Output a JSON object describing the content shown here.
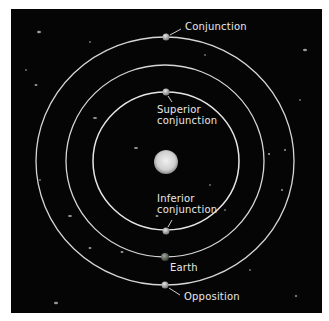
{
  "diagram": {
    "background_color": "#050505",
    "orbit_color": "#d8d8d8",
    "sun": {
      "label": "",
      "color": "#d9d9d9"
    },
    "labels": {
      "conjunction": "Conjunction",
      "superior_line1": "Superior",
      "superior_line2": "conjunction",
      "inferior_line1": "Inferior",
      "inferior_line2": "conjunction",
      "earth": "Earth",
      "opposition": "Opposition"
    },
    "orbits": [
      {
        "name": "inner-planet-orbit",
        "rx": 73,
        "ry": 69
      },
      {
        "name": "earth-orbit",
        "rx": 99,
        "ry": 96
      },
      {
        "name": "outer-planet-orbit",
        "rx": 129,
        "ry": 124
      }
    ]
  }
}
